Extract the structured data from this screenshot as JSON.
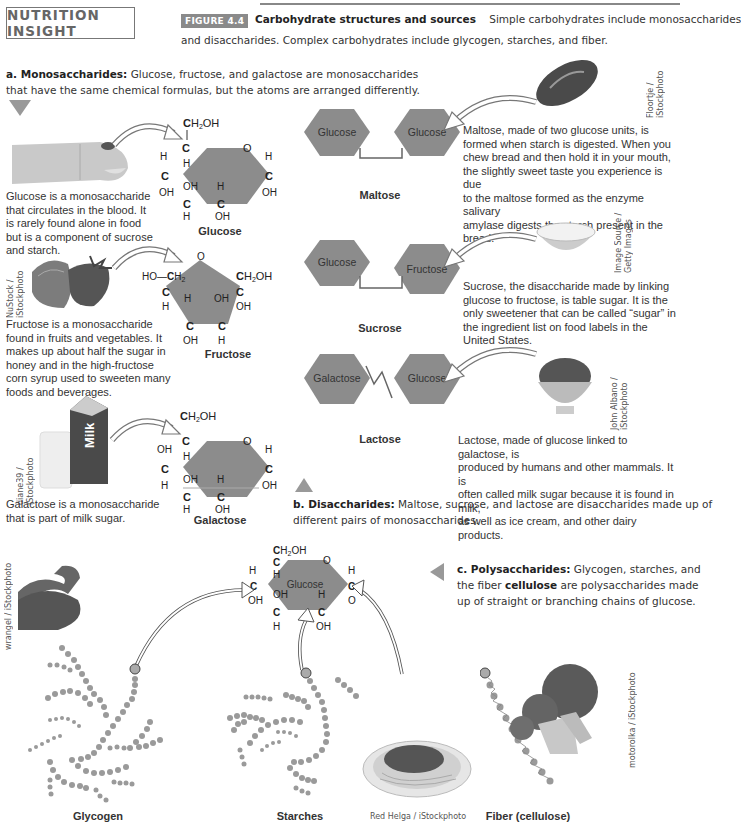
{
  "header": {
    "box_title": "NUTRITION INSIGHT",
    "figure_tag": "FIGURE 4.4",
    "figure_title": "Carbohydrate structures and sources",
    "caption_line1": "Simple carbohydrates include monosaccharides",
    "caption_line2": "and disaccharides. Complex carbohydrates include glycogen, starches, and fiber."
  },
  "section_a": {
    "heading": "a. Monosaccharides:",
    "text_line1": "Glucose, fructose, and galactose are monosaccharides",
    "text_line2": "that have the same chemical formulas, but the atoms are arranged differently.",
    "items": [
      {
        "name": "Glucose",
        "description": [
          "Glucose is a monosaccharide",
          "that circulates in the blood. It",
          "is rarely found alone in food",
          "but is a component of sucrose",
          "and starch."
        ],
        "image": "finger-blood-drop-photo"
      },
      {
        "name": "Fructose",
        "description": [
          "Fructose is a monosaccharide",
          "found in fruits and vegetables. It",
          "makes up about half the sugar in",
          "honey and in the high-fructose",
          "corn syrup used to sweeten many",
          "foods and beverages."
        ],
        "image": "strawberries-photo",
        "credit": [
          "NuStock /",
          "iStockphoto"
        ]
      },
      {
        "name": "Galactose",
        "description": [
          "Galactose is a monosaccharide",
          "that is part of milk sugar."
        ],
        "image": "milk-carton-glass-photo",
        "credit": [
          "diane39 /",
          "iStockphoto"
        ],
        "carton_text": "Milk"
      }
    ],
    "atoms": {
      "ch2oh": "CH2OH",
      "c": "C",
      "h": "H",
      "o": "O",
      "oh": "OH",
      "ho_ch2": "HO—CH2"
    }
  },
  "section_b": {
    "heading": "b. Disaccharides:",
    "text_line1": "Maltose, sucrose, and lactose are disaccharides made up of",
    "text_line2": "different pairs of monosaccharides.",
    "items": [
      {
        "name": "Maltose",
        "units": [
          "Glucose",
          "Glucose"
        ],
        "description": [
          "Maltose, made of two glucose units, is",
          "formed when starch is digested. When you",
          "chew bread and then hold it in your mouth,",
          "the slightly sweet taste you experience is due",
          "to the maltose formed as the enzyme salivary",
          "amylase digests the starch present in the",
          "bread."
        ],
        "image": "bread-roll-photo",
        "credit": [
          "Floortje /",
          "iStockphoto"
        ]
      },
      {
        "name": "Sucrose",
        "units": [
          "Glucose",
          "Fructose"
        ],
        "description": [
          "Sucrose, the disaccharide made by linking",
          "glucose to fructose, is table sugar. It is the",
          "only sweetener that can be called “sugar” in",
          "the ingredient list on food labels in the",
          "United States."
        ],
        "image": "sugar-bowl-photo",
        "credit": [
          "Image Source /",
          "Getty Images"
        ]
      },
      {
        "name": "Lactose",
        "units": [
          "Galactose",
          "Glucose"
        ],
        "description": [
          "Lactose, made of glucose linked to galactose, is",
          "produced by humans and other mammals. It is",
          "often called milk sugar because it is found in milk,",
          "as well as ice cream, and other dairy products."
        ],
        "image": "ice-cream-bowl-photo",
        "credit": [
          "John Albano /",
          "iStockphoto"
        ]
      }
    ]
  },
  "section_c": {
    "heading": "c. Polysaccharides:",
    "text_line1": "Glycogen, starches, and",
    "text_line2_pre": "the fiber ",
    "text_line2_bold": "cellulose",
    "text_line2_post": " are polysaccharides made",
    "text_line3": "up of straight or branching chains of glucose.",
    "center_unit": "Glucose",
    "items": [
      {
        "name": "Glycogen",
        "image": "flexed-arm-photo",
        "credit": "wrangel / iStockphoto"
      },
      {
        "name": "Starches",
        "image": "spaghetti-plate-photo",
        "credit": "Red Helga / iStockphoto"
      },
      {
        "name": "Fiber (cellulose)",
        "image": "broccoli-photo",
        "credit": "motorolka / iStockphoto"
      }
    ]
  },
  "colors": {
    "hexagon_fill": "#8c8c8c",
    "ring_fill": "#909090",
    "dot_fill": "#9a9a9a",
    "triangle": "#999999",
    "tag_bg": "#8a8a8a"
  }
}
